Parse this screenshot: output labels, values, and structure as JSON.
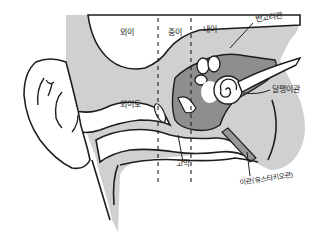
{
  "regions": {
    "outer_ear": "외이",
    "middle_ear": "중이",
    "inner_ear": "내이"
  },
  "labels": {
    "semicircular_canals": "반고리관",
    "cochlea": "달팽이관",
    "ear_canal": "외이도",
    "eardrum": "고막",
    "eustachian_tube": "이관(유스타키오관)"
  },
  "colors": {
    "tissue": "#cfcfcf",
    "dark_tissue": "#8e8e8e",
    "outline": "#1e1e1e",
    "background": "#ffffff"
  }
}
